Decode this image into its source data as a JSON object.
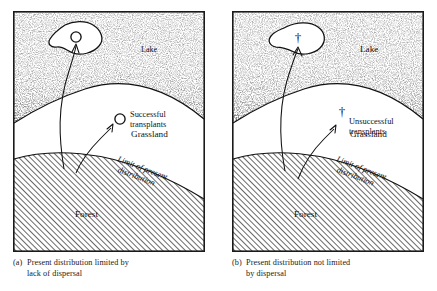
{
  "figure": {
    "type": "two-panel-schematic-diagram"
  },
  "panels": [
    {
      "id": "a",
      "tag": "(a)",
      "caption_line1": "Present distribution limited by",
      "caption_line2": "lack of dispersal",
      "regions": [
        {
          "name": "lake",
          "label": "Lake",
          "texture": "stipple"
        },
        {
          "name": "grassland",
          "label": "Grassland",
          "texture": "blank"
        },
        {
          "name": "forest",
          "label": "Forest",
          "texture": "diagonal-hatch"
        }
      ],
      "boundary_label_line1": "Limit of present",
      "boundary_label_line2": "distribution",
      "transplant_label_line1": "Successful",
      "transplant_label_line2": "transplants",
      "marker_symbol": "circle",
      "markers": [
        {
          "name": "island-transplant-marker",
          "symbol": "circle",
          "location": "island-in-lake"
        },
        {
          "name": "grassland-transplant-marker",
          "symbol": "circle",
          "location": "grassland"
        }
      ],
      "arrows": [
        {
          "name": "dispersal-arrow-to-island",
          "from": "forest",
          "to": "island-in-lake"
        },
        {
          "name": "dispersal-arrow-to-grassland",
          "from": "forest",
          "to": "grassland"
        }
      ]
    },
    {
      "id": "b",
      "tag": "(b)",
      "caption_line1": "Present distribution not limited",
      "caption_line2": "by dispersal",
      "regions": [
        {
          "name": "lake",
          "label": "Lake",
          "texture": "stipple"
        },
        {
          "name": "grassland",
          "label": "Grassland",
          "texture": "blank"
        },
        {
          "name": "forest",
          "label": "Forest",
          "texture": "diagonal-hatch"
        }
      ],
      "boundary_label_line1": "Limit of present",
      "boundary_label_line2": "distribution",
      "transplant_label_line1": "Unsuccessful",
      "transplant_label_line2": "transplants",
      "marker_symbol": "dagger",
      "markers": [
        {
          "name": "island-transplant-marker",
          "symbol": "dagger",
          "location": "island-in-lake"
        },
        {
          "name": "grassland-transplant-marker",
          "symbol": "dagger",
          "location": "grassland"
        }
      ],
      "arrows": [
        {
          "name": "dispersal-arrow-to-island",
          "from": "forest",
          "to": "island-in-lake"
        },
        {
          "name": "dispersal-arrow-to-grassland",
          "from": "forest",
          "to": "grassland"
        }
      ]
    }
  ],
  "symbols": {
    "dagger": "†"
  },
  "colors": {
    "ink": "#1a1a1a",
    "paper": "#ffffff",
    "hatch": "#3a3a3a",
    "stipple": "#2b2b2b"
  }
}
